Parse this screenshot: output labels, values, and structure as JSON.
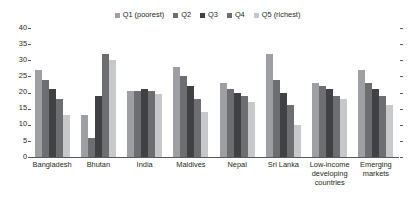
{
  "chart_data": {
    "type": "bar",
    "title": "",
    "xlabel": "",
    "ylabel": "",
    "ylim": [
      0,
      40
    ],
    "yticks": [
      0,
      5,
      10,
      15,
      20,
      25,
      30,
      35,
      40
    ],
    "grid": false,
    "legend_position": "top-center",
    "categories": [
      "Bangladesh",
      "Bhutan",
      "India",
      "Maldives",
      "Nepal",
      "Sri Lanka",
      "Low-income developing countries",
      "Emerging markets"
    ],
    "category_lines": [
      [
        "Bangladesh"
      ],
      [
        "Bhutan"
      ],
      [
        "India"
      ],
      [
        "Maldives"
      ],
      [
        "Nepal"
      ],
      [
        "Sri Lanka"
      ],
      [
        "Low-income",
        "developing",
        "countries"
      ],
      [
        "Emerging",
        "markets"
      ]
    ],
    "series": [
      {
        "name": "Q1 (poorest)",
        "color": "#9d9fa2",
        "values": [
          27,
          13,
          20.5,
          28,
          23,
          32,
          23,
          27
        ]
      },
      {
        "name": "Q2",
        "color": "#6d6e71",
        "values": [
          24,
          6,
          20.5,
          25,
          21,
          24,
          22,
          23
        ]
      },
      {
        "name": "Q3",
        "color": "#414042",
        "values": [
          21,
          19,
          21,
          22,
          20,
          20,
          21,
          21
        ]
      },
      {
        "name": "Q4",
        "color": "#6d6e71",
        "values": [
          18,
          32,
          20.5,
          18,
          19,
          16,
          19,
          19
        ]
      },
      {
        "name": "Q5 (richest)",
        "color": "#c7c8ca",
        "values": [
          13,
          30,
          19.5,
          14,
          17,
          10,
          18,
          16
        ]
      }
    ]
  },
  "axis": {
    "tick_color": "#58595b",
    "baseline_color": "#58595b"
  }
}
